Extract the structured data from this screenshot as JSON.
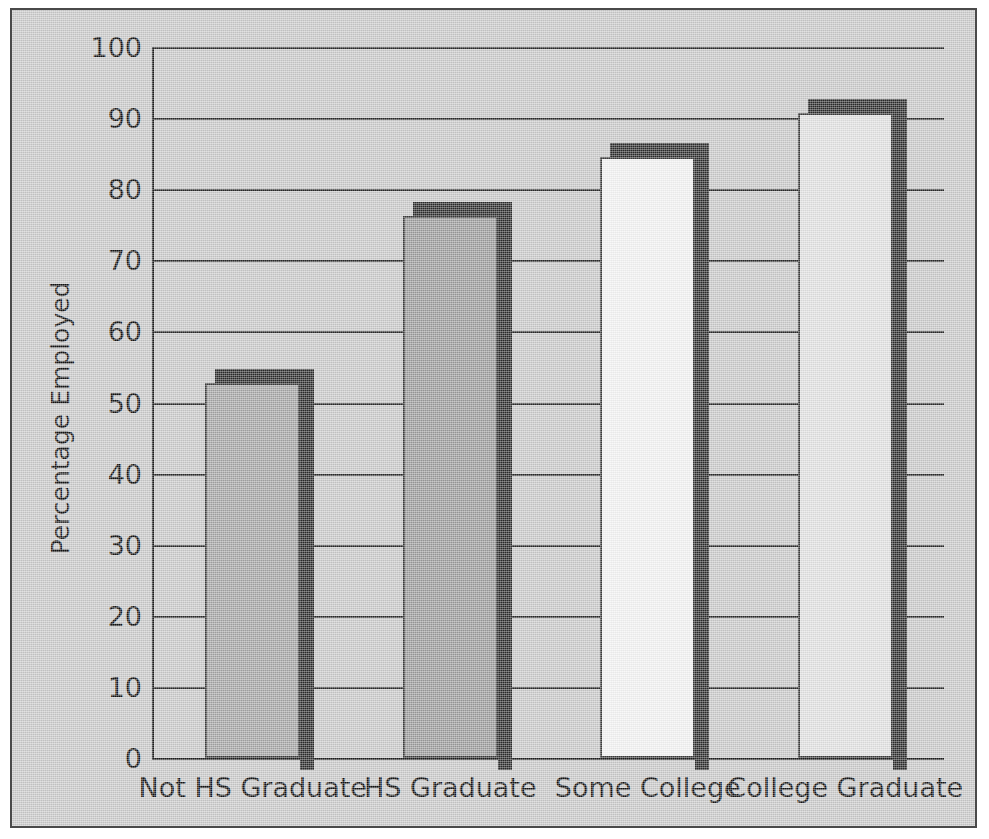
{
  "chart_data": {
    "type": "bar",
    "title": "",
    "subtitle": "",
    "xlabel": "",
    "ylabel": "Percentage Employed",
    "categories": [
      "Not HS Graduate",
      "HS Graduate",
      "Some College",
      "College Graduate"
    ],
    "values": [
      52.7,
      76.3,
      84.6,
      90.7
    ],
    "ylim": [
      0,
      100
    ],
    "yticks": [
      0,
      10,
      20,
      30,
      40,
      50,
      60,
      70,
      80,
      90,
      100
    ],
    "ytick_labels": [
      "0",
      "10",
      "20",
      "30",
      "40",
      "50",
      "60",
      "70",
      "80",
      "90",
      "100"
    ],
    "grid": true,
    "legend": null,
    "legend_position": "none",
    "bar_colors": [
      "#a3a3a3",
      "#9a9a9a",
      "#f2f2f2",
      "#e0e0e0"
    ],
    "bar_shadow_color": "#2b2b2b",
    "bar_edge_color": "#3b3b3b",
    "plot_background": "#c8c8c8",
    "figure_background": "#c8c8c8",
    "axis_color": "#1c1c1c",
    "grid_color": "#2a2a2a",
    "text_color": "#111111"
  }
}
